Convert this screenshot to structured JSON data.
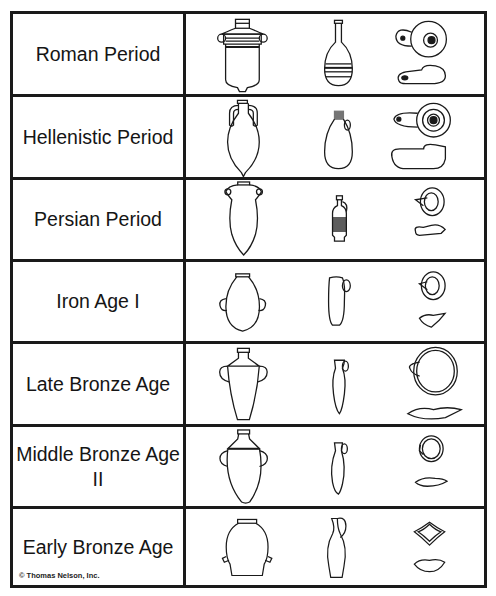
{
  "columns": [
    "Period",
    "Storage jar",
    "Juglet",
    "Oil lamp (top and side views)"
  ],
  "rows": [
    {
      "label": "Roman Period",
      "jar": "banded storage jar with ring handles",
      "juglet": "long-necked banded flask",
      "lamp": "round closed lamp with filling hole and nozzle"
    },
    {
      "label": "Hellenistic Period",
      "jar": "amphora with pointed toe",
      "juglet": "small juglet with handle",
      "lamp": "closed lamp with long nozzle"
    },
    {
      "label": "Persian Period",
      "jar": "pointed-base jar with loop handles",
      "juglet": "decorated lekythos",
      "lamp": "open saucer lamp with pinched spout"
    },
    {
      "label": "Iron Age I",
      "jar": "ovoid jar with side handles",
      "juglet": "squat juglet with handle",
      "lamp": "open saucer lamp"
    },
    {
      "label": "Late Bronze Age",
      "jar": "carinated storage jar with handles",
      "juglet": "dipper juglet",
      "lamp": "wide saucer lamp with pinched spout"
    },
    {
      "label": "Middle Bronze Age II",
      "jar": "ovoid storage jar with handles",
      "juglet": "dipper juglet",
      "lamp": "small saucer lamp"
    },
    {
      "label": "Early Bronze Age",
      "jar": "wide jar with ledge handles",
      "juglet": "tall jug with high handle",
      "lamp": "four-spouted lamp"
    }
  ],
  "copyright": "© Thomas Nelson, Inc.",
  "colors": {
    "line": "#1a1a1a",
    "background": "#ffffff"
  }
}
